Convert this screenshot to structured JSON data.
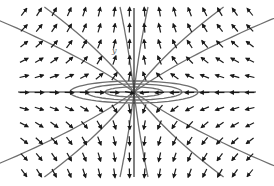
{
  "figure": {
    "type": "phase-portrait",
    "axis_labels": {
      "y": "y"
    },
    "colors": {
      "arrow": "#1a1a1a",
      "trajectory": "#6e6e6e",
      "axis": "#2a2a2a",
      "background": "#ffffff"
    },
    "origin_px": [
      134,
      92
    ],
    "plot_bounds_px": {
      "left": 18,
      "right": 256,
      "top": 8,
      "bottom": 177
    },
    "grid": {
      "cols": 16,
      "rows": 11
    }
  }
}
